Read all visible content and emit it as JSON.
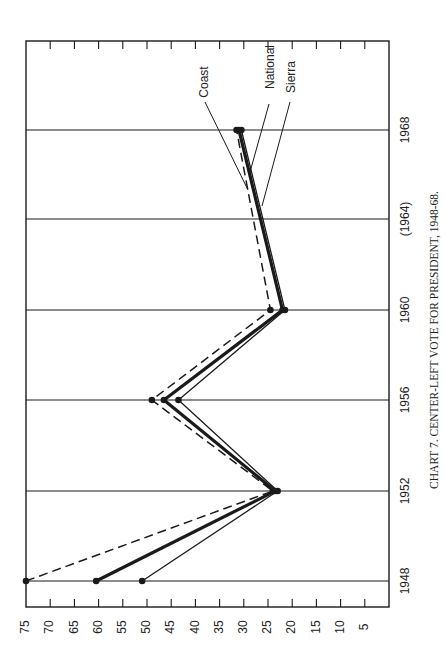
{
  "chart_data": {
    "type": "line",
    "orientation": "rotated-90",
    "title": "CHART 7. CENTER-LEFT VOTE FOR PRESIDENT, 1948-68.",
    "xlabel": "",
    "ylabel": "",
    "x": [
      "1948",
      "1952",
      "1956",
      "1960",
      "(1964)",
      "1968"
    ],
    "x_numeric": [
      1948,
      1952,
      1956,
      1960,
      1964,
      1968
    ],
    "ylim": [
      0,
      75
    ],
    "y_ticks": [
      75,
      70,
      65,
      60,
      55,
      50,
      45,
      40,
      35,
      30,
      25,
      20,
      15,
      10,
      5
    ],
    "grid": "vertical lines at each election year",
    "series": [
      {
        "name": "Coast",
        "style": "dashed",
        "values": [
          75,
          24,
          49,
          24.5,
          null,
          31.5
        ]
      },
      {
        "name": "National",
        "style": "thick-solid",
        "values": [
          60.5,
          23.5,
          46.5,
          22,
          null,
          31
        ]
      },
      {
        "name": "Sierra",
        "style": "thin-solid",
        "values": [
          51,
          23,
          43.5,
          21.5,
          null,
          30.5
        ]
      }
    ],
    "annotations": [
      "(1964) shown in parentheses — no data point plotted"
    ],
    "legend_position": "inline labels with leader lines near 1968"
  },
  "labels": {
    "caption": "CHART 7. CENTER-LEFT VOTE FOR PRESIDENT, 1948-68.",
    "series": [
      "Coast",
      "National",
      "Sierra"
    ],
    "years": [
      "1948",
      "1952",
      "1956",
      "1960",
      "(1964)",
      "1968"
    ],
    "ticks": [
      "75",
      "70",
      "65",
      "60",
      "55",
      "50",
      "45",
      "40",
      "35",
      "30",
      "25",
      "20",
      "15",
      "10",
      "5"
    ]
  },
  "colors": {
    "ink": "#1a1a1a",
    "background": "#ffffff"
  }
}
